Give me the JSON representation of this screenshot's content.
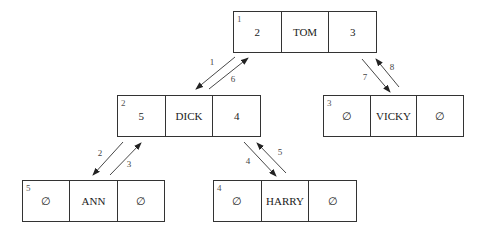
{
  "diagram": {
    "type": "binary tree (array/linked representation)",
    "null_symbol": "∅",
    "nodes": [
      {
        "id": "tom",
        "index": "1",
        "left": "2",
        "name": "TOM",
        "right": "3",
        "box": {
          "x": 233,
          "y": 11,
          "w": 144,
          "h": 42
        }
      },
      {
        "id": "dick",
        "index": "2",
        "left": "5",
        "name": "DICK",
        "right": "4",
        "box": {
          "x": 117,
          "y": 95,
          "w": 144,
          "h": 42
        }
      },
      {
        "id": "vicky",
        "index": "3",
        "left": "∅",
        "name": "VICKY",
        "right": "∅",
        "box": {
          "x": 323,
          "y": 95,
          "w": 141,
          "h": 42
        }
      },
      {
        "id": "ann",
        "index": "5",
        "left": "∅",
        "name": "ANN",
        "right": "∅",
        "box": {
          "x": 22,
          "y": 180,
          "w": 143,
          "h": 42
        }
      },
      {
        "id": "harry",
        "index": "4",
        "left": "∅",
        "name": "HARRY",
        "right": "∅",
        "box": {
          "x": 213,
          "y": 180,
          "w": 144,
          "h": 42
        }
      }
    ],
    "arrows": [
      {
        "label": "1",
        "from": "tom",
        "to": "dick",
        "x1": 235,
        "y1": 57,
        "x2": 196,
        "y2": 89,
        "lx": 212,
        "ly": 65
      },
      {
        "label": "6",
        "from": "dick",
        "to": "tom",
        "x1": 209,
        "y1": 89,
        "x2": 248,
        "y2": 58,
        "lx": 233,
        "ly": 82
      },
      {
        "label": "7",
        "from": "tom",
        "to": "vicky",
        "x1": 362,
        "y1": 59,
        "x2": 390,
        "y2": 92,
        "lx": 365,
        "ly": 80
      },
      {
        "label": "8",
        "from": "vicky",
        "to": "tom",
        "x1": 399,
        "y1": 87,
        "x2": 376,
        "y2": 59,
        "lx": 392,
        "ly": 70
      },
      {
        "label": "2",
        "from": "dick",
        "to": "ann",
        "x1": 123,
        "y1": 142,
        "x2": 93,
        "y2": 175,
        "lx": 100,
        "ly": 156
      },
      {
        "label": "3",
        "from": "ann",
        "to": "dick",
        "x1": 110,
        "y1": 175,
        "x2": 141,
        "y2": 143,
        "lx": 129,
        "ly": 167
      },
      {
        "label": "4",
        "from": "dick",
        "to": "harry",
        "x1": 244,
        "y1": 142,
        "x2": 276,
        "y2": 176,
        "lx": 248,
        "ly": 164
      },
      {
        "label": "5",
        "from": "harry",
        "to": "dick",
        "x1": 286,
        "y1": 173,
        "x2": 257,
        "y2": 143,
        "lx": 280,
        "ly": 155
      }
    ]
  }
}
